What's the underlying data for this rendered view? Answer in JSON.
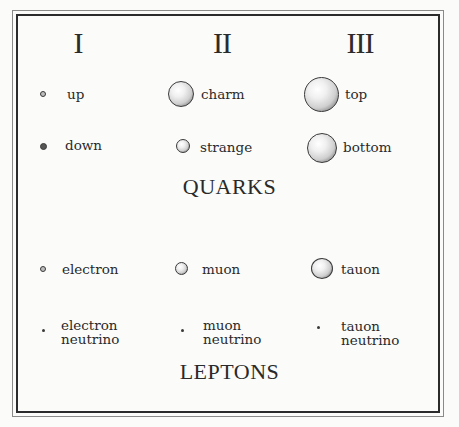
{
  "generations": [
    "I",
    "II",
    "III"
  ],
  "quarks": {
    "title": "QUARKS",
    "rows": [
      [
        {
          "name": "up",
          "size": "tiny"
        },
        {
          "name": "charm",
          "size": "large"
        },
        {
          "name": "top",
          "size": "largest"
        }
      ],
      [
        {
          "name": "down",
          "size": "tiny"
        },
        {
          "name": "strange",
          "size": "small"
        },
        {
          "name": "bottom",
          "size": "large"
        }
      ]
    ]
  },
  "leptons": {
    "title": "LEPTONS",
    "rows": [
      [
        {
          "name": "electron",
          "size": "tiny"
        },
        {
          "name": "muon",
          "size": "small"
        },
        {
          "name": "tauon",
          "size": "medium"
        }
      ],
      [
        {
          "name": "electron",
          "name2": "neutrino",
          "size": "point"
        },
        {
          "name": "muon",
          "name2": "neutrino",
          "size": "point"
        },
        {
          "name": "tauon",
          "name2": "neutrino",
          "size": "point"
        }
      ]
    ]
  }
}
